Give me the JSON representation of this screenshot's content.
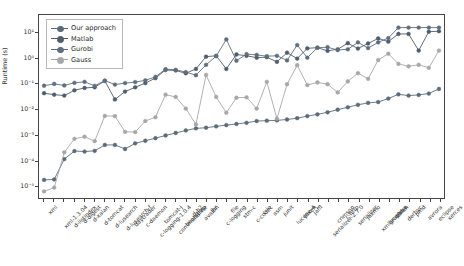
{
  "chart_data": {
    "type": "line",
    "title": "",
    "xlabel": "",
    "ylabel": "Runtime (s)",
    "yscale": "log",
    "ylim": [
      3.2e-06,
      50
    ],
    "grid": false,
    "legend_position": "upper left",
    "ytick_labels": [
      "10¹",
      "10⁰",
      "10⁻¹",
      "10⁻²",
      "10⁻³",
      "10⁻⁴",
      "10⁻⁵"
    ],
    "ytick_values": [
      10,
      1,
      0.1,
      0.01,
      0.001,
      0.0001,
      1e-05
    ],
    "categories": [
      "xml",
      "xml-1.3.04",
      "d-listindex",
      "d-digest",
      "d-xalan",
      "d-tomcat",
      "d-lusearch",
      "d-lusearch-f",
      "daytrader",
      "c-daemon",
      "c-logging-1.0.4",
      "tomcat-j",
      "commandline",
      "bootstrap",
      "d-h2",
      "avalon",
      "jhr",
      "c-logging",
      "file",
      "stm-c",
      "c-codec",
      "c-io",
      "asm",
      "junit",
      "lucene-4",
      "jaxen",
      "jaffl",
      "serializer-2.7.0",
      "crimson",
      "c-http",
      "serializer",
      "jaxmo",
      "xmlgraphics",
      "lucene-c",
      "xalan",
      "derbyc",
      "pmd",
      "avrora",
      "eclipse",
      "xerces"
    ],
    "series": [
      {
        "name": "Our approach",
        "color": "#5b6b7a",
        "values": [
          1.65e-05,
          1.72e-05,
          0.000108,
          0.000225,
          0.000215,
          0.000228,
          0.00039,
          0.00039,
          0.00027,
          0.00045,
          0.00057,
          0.00072,
          0.00092,
          0.00115,
          0.00145,
          0.00175,
          0.00185,
          0.0021,
          0.00235,
          0.0026,
          0.0029,
          0.0034,
          0.0035,
          0.0036,
          0.0039,
          0.0044,
          0.0053,
          0.0062,
          0.0075,
          0.0095,
          0.0118,
          0.0148,
          0.0175,
          0.019,
          0.026,
          0.038,
          0.034,
          0.036,
          0.041,
          0.062
        ]
      },
      {
        "name": "Matlab",
        "color": "#4e5d6c",
        "values": [
          0.042,
          0.037,
          0.034,
          0.055,
          0.068,
          0.072,
          0.128,
          0.024,
          0.049,
          0.072,
          0.105,
          0.165,
          0.345,
          0.33,
          0.255,
          0.38,
          1.15,
          1.25,
          0.38,
          1.4,
          1.25,
          1.05,
          1.1,
          0.72,
          1.65,
          0.97,
          2.45,
          2.6,
          1.95,
          2.25,
          3.9,
          2.4,
          3.8,
          6.0,
          4.5,
          9.0,
          9.0,
          2.0,
          11.0,
          11.5
        ]
      },
      {
        "name": "Gurobi",
        "color": "#5f6e7d",
        "values": [
          0.083,
          0.098,
          0.085,
          0.108,
          0.118,
          0.082,
          0.132,
          0.092,
          0.105,
          0.115,
          0.135,
          0.185,
          0.37,
          0.35,
          0.285,
          0.215,
          0.55,
          1.2,
          5.5,
          0.8,
          1.45,
          1.35,
          1.2,
          1.25,
          0.82,
          3.3,
          1.05,
          2.6,
          2.7,
          2.1,
          2.25,
          4.2,
          2.5,
          4.2,
          6.2,
          16.0,
          16.0,
          16.0,
          16.0,
          16.0
        ]
      },
      {
        "name": "Gauss",
        "color": "#a7a7a7",
        "values": [
          5.8e-06,
          8.2e-06,
          0.0002,
          0.00068,
          0.00082,
          0.00055,
          0.0054,
          0.0053,
          0.00128,
          0.00125,
          0.0034,
          0.0048,
          0.037,
          0.03,
          0.0105,
          0.0025,
          0.22,
          0.03,
          0.0072,
          0.028,
          0.029,
          0.0105,
          0.118,
          0.0042,
          0.095,
          0.53,
          0.088,
          0.112,
          0.095,
          0.045,
          0.122,
          0.26,
          0.155,
          0.85,
          1.5,
          0.6,
          0.48,
          0.55,
          0.42,
          2.0
        ]
      }
    ]
  },
  "legend": {
    "entries": [
      "Our approach",
      "Matlab",
      "Gurobi",
      "Gauss"
    ]
  }
}
